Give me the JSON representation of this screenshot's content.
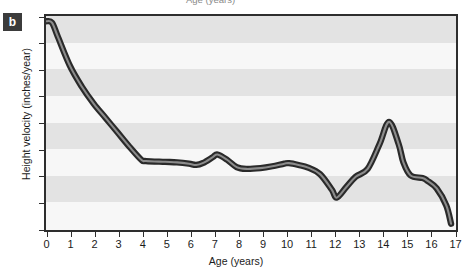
{
  "figure": {
    "panel_label": "b",
    "clipped_caption_above": "Age  (years)"
  },
  "chart_data": {
    "type": "line",
    "title": "",
    "subtitle": "",
    "xlabel": "Age  (years)",
    "ylabel": "Height velocity (inches/year)",
    "xlim": [
      0,
      17
    ],
    "ylim": [
      0,
      8
    ],
    "xticks": [
      "0",
      "1",
      "2",
      "3",
      "4",
      "5",
      "6",
      "7",
      "8",
      "9",
      "10",
      "11",
      "12",
      "13",
      "14",
      "15",
      "16",
      "17"
    ],
    "yticks": [
      "0",
      "1",
      "2",
      "3",
      "4",
      "5",
      "6",
      "7",
      "8"
    ],
    "grid": "alternating horizontal gray bands, one unit tall",
    "legend": "none",
    "series": [
      {
        "name": "Height velocity",
        "color": "#4a4a4a",
        "x": [
          0,
          0.25,
          0.5,
          1,
          1.5,
          2,
          2.5,
          3,
          3.5,
          4,
          4.2,
          5,
          5.5,
          6,
          6.3,
          6.6,
          7,
          7.2,
          7.6,
          8,
          8.4,
          9,
          9.5,
          10,
          10.2,
          10.6,
          11,
          11.5,
          12,
          12.2,
          12.6,
          13,
          13.5,
          14,
          14.4,
          14.8,
          15,
          15.3,
          15.8,
          16,
          16.4,
          16.8,
          17
        ],
        "y": [
          7.8,
          7.75,
          7.2,
          6.1,
          5.3,
          4.65,
          4.1,
          3.55,
          3.0,
          2.5,
          2.45,
          2.42,
          2.4,
          2.35,
          2.3,
          2.38,
          2.6,
          2.7,
          2.5,
          2.22,
          2.15,
          2.18,
          2.25,
          2.35,
          2.37,
          2.3,
          2.2,
          1.95,
          1.35,
          1.05,
          1.45,
          1.85,
          2.15,
          3.1,
          3.95,
          3.1,
          2.4,
          1.9,
          1.8,
          1.7,
          1.4,
          0.75,
          0.05
        ]
      }
    ],
    "annotations": [
      {
        "label": "infant peak velocity",
        "x": 0,
        "y": 7.8
      },
      {
        "label": "childhood plateau",
        "x": 4.5,
        "y": 2.45
      },
      {
        "label": "mid-childhood spurt",
        "x": 7.2,
        "y": 2.7
      },
      {
        "label": "pre-pubertal trough",
        "x": 12.2,
        "y": 1.05
      },
      {
        "label": "peak height velocity",
        "x": 14.4,
        "y": 3.95
      },
      {
        "label": "epiphyseal fusion",
        "x": 17,
        "y": 0.05
      }
    ]
  },
  "style": {
    "frame_color": "#2e2e2e",
    "band_color": "#e3e3e3",
    "plot_background": "#f7f7f7",
    "line_color": "#4a4a4a",
    "line_outline": "#2a2a2a",
    "badge_background": "#3b3b3b",
    "badge_text": "#ffffff"
  }
}
